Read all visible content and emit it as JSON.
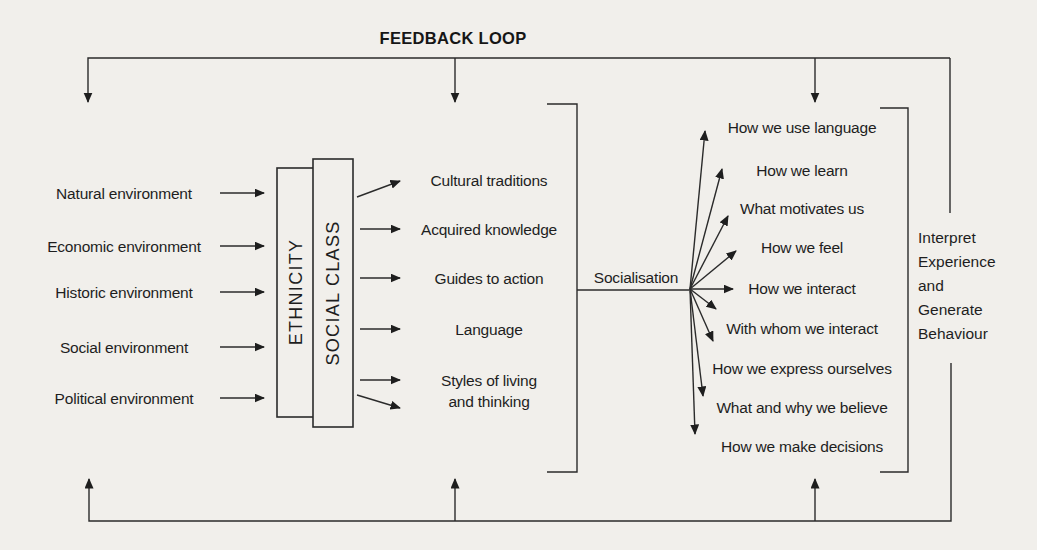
{
  "title": "FEEDBACK LOOP",
  "colors": {
    "paper": "#f1efeb",
    "ink": "#1e1e1e"
  },
  "environments": {
    "items": [
      "Natural environment",
      "Economic environment",
      "Historic environment",
      "Social environment",
      "Political environment"
    ]
  },
  "filters": {
    "ethnicity": "ETHNICITY",
    "social_class": "SOCIAL CLASS"
  },
  "cultural_outputs": {
    "items": [
      "Cultural traditions",
      "Acquired knowledge",
      "Guides to action",
      "Language",
      "Styles of living\nand thinking"
    ]
  },
  "socialisation": {
    "label": "Socialisation"
  },
  "outcomes": {
    "items": [
      "How we use language",
      "How we learn",
      "What motivates us",
      "How we feel",
      "How we interact",
      "With whom we interact",
      "How we express ourselves",
      "What and why we believe",
      "How we make decisions"
    ]
  },
  "interpretation": {
    "text": "Interpret\nExperience\nand\nGenerate\nBehaviour"
  }
}
